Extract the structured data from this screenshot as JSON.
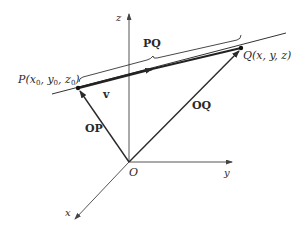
{
  "figure": {
    "colors": {
      "ink": "#2a2a2a",
      "axis": "#555555",
      "background": "#ffffff"
    },
    "axes": {
      "x_label": "x",
      "y_label": "y",
      "z_label": "z",
      "origin_label": "O"
    },
    "points": {
      "P": {
        "name": "P",
        "open": "(",
        "x": "x",
        "y": "y",
        "z": "z",
        "sub": "0",
        "sep": ", ",
        "close": ")"
      },
      "Q": {
        "label": "Q(x, y, z)"
      }
    },
    "vectors": {
      "v": "v",
      "PQ": "PQ",
      "OP": "OP",
      "OQ": "OQ"
    }
  }
}
